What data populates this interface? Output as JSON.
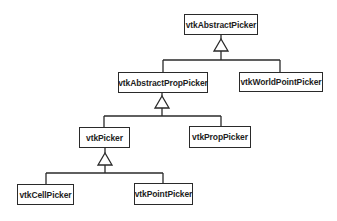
{
  "diagram": {
    "type": "class-hierarchy",
    "colors": {
      "line": "#2a2a2a",
      "text": "#1e1e1e",
      "background": "#ffffff"
    },
    "nodes": {
      "abstract_picker": "vtkAbstractPicker",
      "abstract_prop_picker": "vtkAbstractPropPicker",
      "world_point_picker": "vtkWorldPointPicker",
      "picker": "vtkPicker",
      "prop_picker": "vtkPropPicker",
      "cell_picker": "vtkCellPicker",
      "point_picker": "vtkPointPicker"
    },
    "edges": [
      {
        "from": "vtkAbstractPropPicker",
        "to": "vtkAbstractPicker",
        "relation": "inherits"
      },
      {
        "from": "vtkWorldPointPicker",
        "to": "vtkAbstractPicker",
        "relation": "inherits"
      },
      {
        "from": "vtkPicker",
        "to": "vtkAbstractPropPicker",
        "relation": "inherits"
      },
      {
        "from": "vtkPropPicker",
        "to": "vtkAbstractPropPicker",
        "relation": "inherits"
      },
      {
        "from": "vtkCellPicker",
        "to": "vtkPicker",
        "relation": "inherits"
      },
      {
        "from": "vtkPointPicker",
        "to": "vtkPicker",
        "relation": "inherits"
      }
    ]
  }
}
